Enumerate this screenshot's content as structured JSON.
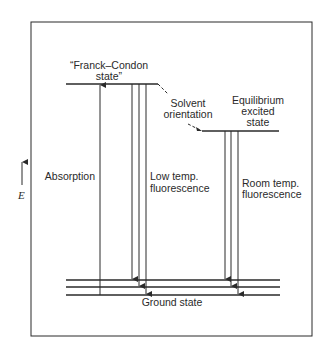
{
  "diagram": {
    "type": "energy-level diagram",
    "axis": {
      "label": "E",
      "direction": "up"
    },
    "states": {
      "franck_condon": {
        "label_line1": "“Franck–Condon",
        "label_line2": "state”"
      },
      "equilibrium": {
        "label_line1": "Equilibrium",
        "label_line2": "excited",
        "label_line3": "state"
      },
      "ground": {
        "label": "Ground state"
      }
    },
    "transitions": {
      "solvent": {
        "label_line1": "Solvent",
        "label_line2": "orientation"
      },
      "absorption": {
        "label": "Absorption"
      },
      "low_temp": {
        "label_line1": "Low temp.",
        "label_line2": "fluorescence"
      },
      "room_temp": {
        "label_line1": "Room temp.",
        "label_line2": "fluorescence"
      }
    },
    "colors": {
      "line": "#2a2a2a",
      "background": "#ffffff"
    }
  }
}
